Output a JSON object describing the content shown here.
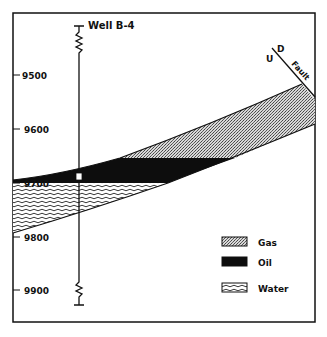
{
  "well": {
    "label": "Well B-4"
  },
  "depth_axis": {
    "ticks": [
      {
        "label": "9500",
        "y": 75
      },
      {
        "label": "9600",
        "y": 129
      },
      {
        "label": "9700",
        "y": 183
      },
      {
        "label": "9800",
        "y": 237
      },
      {
        "label": "9900",
        "y": 290
      }
    ]
  },
  "fault": {
    "label": "Fault",
    "up_label": "U",
    "down_label": "D"
  },
  "legend": {
    "items": [
      {
        "label": "Gas",
        "pattern": "gas"
      },
      {
        "label": "Oil",
        "pattern": "oil"
      },
      {
        "label": "Water",
        "pattern": "water"
      }
    ]
  },
  "colors": {
    "ink": "#111111",
    "gas": "#9a9a9a",
    "oil": "#0d0d0d",
    "background": "#ffffff"
  }
}
